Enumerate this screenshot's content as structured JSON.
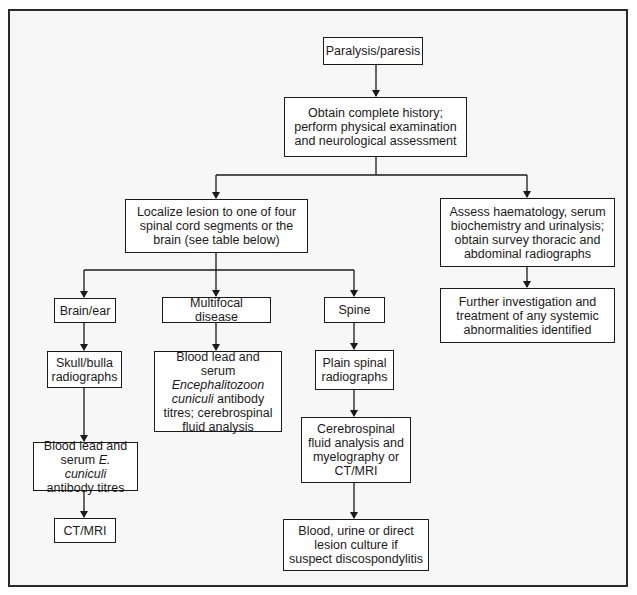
{
  "diagram": {
    "type": "flowchart",
    "colors": {
      "line": "#1a1a1a",
      "box_fill": "#ffffff",
      "background": "#f7f7f7",
      "frame": "#2a2a2a"
    },
    "nodes": {
      "start": {
        "text": "Paralysis/paresis"
      },
      "history": {
        "lines": [
          "Obtain complete history;",
          "perform physical examination",
          "and neurological assessment"
        ]
      },
      "localize": {
        "lines": [
          "Localize lesion to one of four",
          "spinal cord segments or the",
          "brain (see table below)"
        ]
      },
      "assess": {
        "lines": [
          "Assess haematology, serum",
          "biochemistry and urinalysis;",
          "obtain survey thoracic and",
          "abdominal radiographs"
        ]
      },
      "further": {
        "lines": [
          "Further investigation and",
          "treatment of any systemic",
          "abnormalities identified"
        ]
      },
      "brain_ear": {
        "text": "Brain/ear"
      },
      "multifocal": {
        "text": "Multifocal disease"
      },
      "spine": {
        "text": "Spine"
      },
      "skull": {
        "lines": [
          "Skull/bulla",
          "radiographs"
        ]
      },
      "multifocal_tests": {
        "line1": "Blood lead and serum",
        "line2_italic": "Encephalitozoon",
        "line3_italic": "cuniculi",
        "line3_rest": " antibody",
        "line4": "titres; cerebrospinal",
        "line5": "fluid analysis"
      },
      "plain_spinal": {
        "lines": [
          "Plain spinal",
          "radiographs"
        ]
      },
      "brain_blood": {
        "line1": "Blood lead and",
        "line2_pre": "serum ",
        "line2_italic": "E. cuniculi",
        "line3": "antibody titres"
      },
      "csf": {
        "lines": [
          "Cerebrospinal",
          "fluid analysis and",
          "myelography or",
          "CT/MRI"
        ]
      },
      "ctmri": {
        "text": "CT/MRI"
      },
      "culture": {
        "lines": [
          "Blood, urine or direct",
          "lesion culture if",
          "suspect discospondylitis"
        ]
      }
    },
    "edges": [
      [
        "start",
        "history"
      ],
      [
        "history",
        "localize"
      ],
      [
        "history",
        "assess"
      ],
      [
        "assess",
        "further"
      ],
      [
        "localize",
        "brain_ear"
      ],
      [
        "localize",
        "multifocal"
      ],
      [
        "localize",
        "spine"
      ],
      [
        "brain_ear",
        "skull"
      ],
      [
        "skull",
        "brain_blood"
      ],
      [
        "brain_blood",
        "ctmri"
      ],
      [
        "multifocal",
        "multifocal_tests"
      ],
      [
        "spine",
        "plain_spinal"
      ],
      [
        "plain_spinal",
        "csf"
      ],
      [
        "csf",
        "culture"
      ]
    ]
  }
}
